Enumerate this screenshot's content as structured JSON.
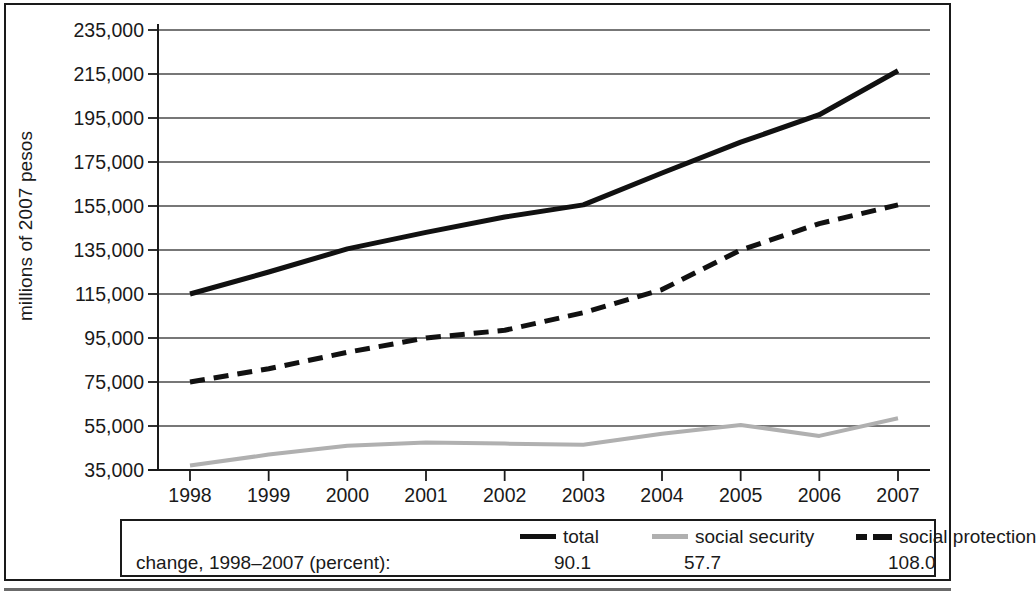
{
  "chart_data": {
    "type": "line",
    "title": "",
    "xlabel": "",
    "ylabel": "millions of 2007 pesos",
    "x": [
      1998,
      1999,
      2000,
      2001,
      2002,
      2003,
      2004,
      2005,
      2006,
      2007
    ],
    "xtick_labels": [
      "1998",
      "1999",
      "2000",
      "2001",
      "2002",
      "2003",
      "2004",
      "2005",
      "2006",
      "2007"
    ],
    "ytick_labels": [
      "235,000",
      "215,000",
      "195,000",
      "175,000",
      "155,000",
      "135,000",
      "115,000",
      "95,000",
      "75,000",
      "55,000",
      "35,000"
    ],
    "ytick_values": [
      235000,
      215000,
      195000,
      175000,
      155000,
      135000,
      115000,
      95000,
      75000,
      55000,
      35000
    ],
    "ylim": [
      35000,
      235000
    ],
    "xlim": [
      1998,
      2007
    ],
    "grid": "horizontal",
    "legend_position": "below-plot",
    "series": [
      {
        "name": "total",
        "style": "solid",
        "color": "#111111",
        "values": [
          115000,
          125000,
          135500,
          143000,
          150000,
          155500,
          170000,
          184000,
          196500,
          216500
        ],
        "change_percent": "90.1"
      },
      {
        "name": "social security",
        "style": "solid",
        "color": "#b0b0b0",
        "values": [
          37000,
          42000,
          46000,
          47500,
          47000,
          46500,
          51500,
          55500,
          50500,
          58500
        ],
        "change_percent": "57.7"
      },
      {
        "name": "social protection",
        "style": "dashed",
        "color": "#111111",
        "values": [
          75000,
          81000,
          88500,
          95000,
          98500,
          106500,
          117000,
          135000,
          147000,
          155500
        ],
        "change_percent": "108.0"
      }
    ]
  },
  "legend": {
    "change_label": "change, 1998–2007 (percent):",
    "entries": [
      {
        "label": "total",
        "value": "90.1"
      },
      {
        "label": "social security",
        "value": "57.7"
      },
      {
        "label": "social protection",
        "value": "108.0"
      }
    ]
  }
}
